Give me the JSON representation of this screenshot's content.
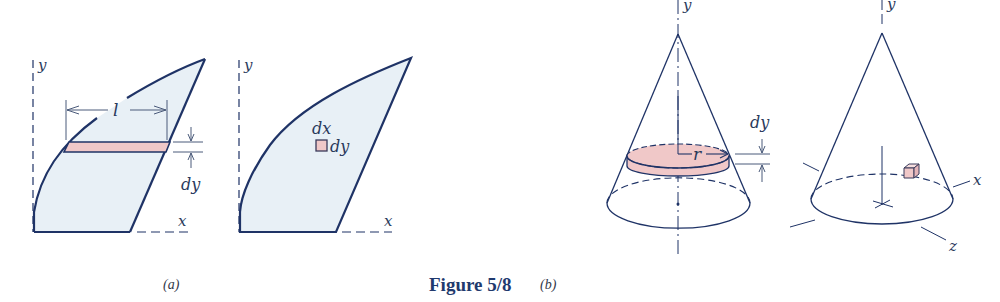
{
  "figure": {
    "caption": "Figure 5/8",
    "colors": {
      "outline": "#1f3366",
      "fill_region": "#e8f0f6",
      "element_fill": "#f0c8c8",
      "element_stroke": "#3a3a5a"
    },
    "part_a": {
      "label": "(a)",
      "left_panel": {
        "axis_y": "y",
        "axis_x": "x",
        "strip_length": "l",
        "strip_thickness": "dy"
      },
      "right_panel": {
        "axis_y": "y",
        "axis_x": "x",
        "element_width": "dx",
        "element_height": "dy"
      }
    },
    "part_b": {
      "label": "(b)",
      "left_cone": {
        "axis_y": "y",
        "disk_radius": "r",
        "disk_thickness": "dy"
      },
      "right_cone": {
        "axis_y": "y",
        "axis_x": "x",
        "axis_z": "z"
      }
    }
  }
}
